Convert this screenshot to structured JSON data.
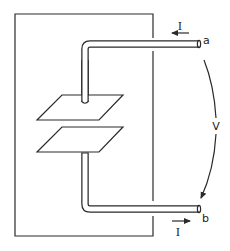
{
  "diagram": {
    "labels": {
      "terminal_a": "a",
      "terminal_b": "b",
      "current_top": "I",
      "current_bottom": "I",
      "voltage": "V"
    },
    "components": [
      {
        "name": "enclosure-box",
        "shape": "rectangle"
      },
      {
        "name": "upper-plate",
        "shape": "parallelogram"
      },
      {
        "name": "lower-plate",
        "shape": "parallelogram"
      },
      {
        "name": "upper-lead-wire",
        "ends_at": "a"
      },
      {
        "name": "lower-lead-wire",
        "ends_at": "b"
      },
      {
        "name": "voltage-arc",
        "from": "a",
        "to": "b"
      }
    ],
    "current_direction": {
      "top": "leftward (into a)",
      "bottom": "rightward (out of b)"
    },
    "colors": {
      "stroke": "#2a2a2a",
      "background": "#ffffff"
    }
  }
}
